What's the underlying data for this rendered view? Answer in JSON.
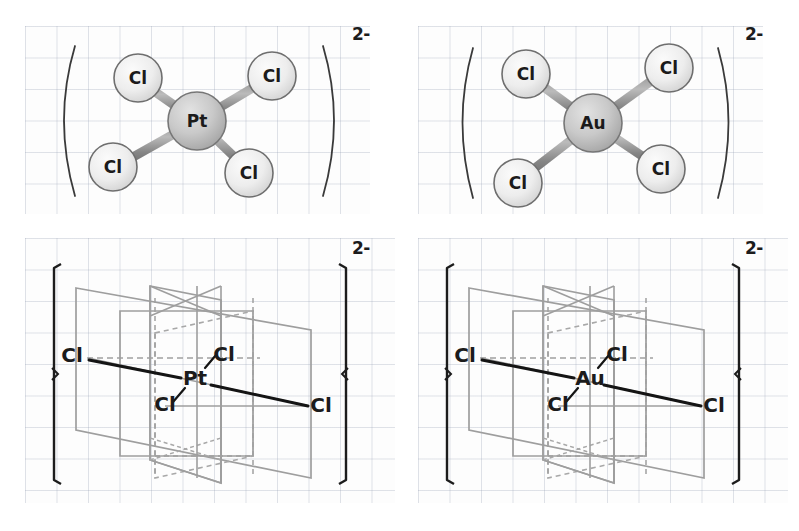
{
  "figure": {
    "background": "graph-paper",
    "grid_color": "#96a0b4",
    "panel_background": "#fdfdfd"
  },
  "panels": [
    {
      "id": "top-left",
      "style": "ball-and-stick",
      "enclosure": "parentheses",
      "charge": "2-",
      "center_atom": "Pt",
      "ligands": [
        "Cl",
        "Cl",
        "Cl",
        "Cl"
      ],
      "ligand_positions": [
        "upper-left",
        "upper-right",
        "lower-left",
        "lower-right"
      ],
      "geometry": "square planar",
      "center_color": "#c9c9c9",
      "ligand_color": "#ebebeb",
      "bond_color": "#8a8a8a"
    },
    {
      "id": "top-right",
      "style": "ball-and-stick",
      "enclosure": "parentheses",
      "charge": "2-",
      "center_atom": "Au",
      "ligands": [
        "Cl",
        "Cl",
        "Cl",
        "Cl"
      ],
      "ligand_positions": [
        "upper-left",
        "upper-right",
        "lower-left",
        "lower-right"
      ],
      "geometry": "square planar",
      "center_color": "#c9c9c9",
      "ligand_color": "#ebebeb",
      "bond_color": "#8a8a8a"
    },
    {
      "id": "bottom-left",
      "style": "symmetry-planes",
      "enclosure": "square-brackets",
      "charge": "2-",
      "center_atom": "Pt",
      "ligands": [
        "Cl",
        "Cl",
        "Cl",
        "Cl"
      ],
      "ligand_positions": [
        "left",
        "upper-right",
        "lower-left-inner",
        "right"
      ],
      "geometry": "square planar",
      "plane_color": "#9a9a9a",
      "bond_color": "#141414",
      "bracket_color": "#1c1c1c"
    },
    {
      "id": "bottom-right",
      "style": "symmetry-planes",
      "enclosure": "square-brackets",
      "charge": "2-",
      "center_atom": "Au",
      "ligands": [
        "Cl",
        "Cl",
        "Cl",
        "Cl"
      ],
      "ligand_positions": [
        "left",
        "upper-right",
        "lower-left-inner",
        "right"
      ],
      "geometry": "square planar",
      "plane_color": "#9a9a9a",
      "bond_color": "#141414",
      "bracket_color": "#1c1c1c"
    }
  ],
  "labels": {
    "pt": "Pt",
    "au": "Au",
    "cl": "Cl",
    "charge": "2-"
  }
}
